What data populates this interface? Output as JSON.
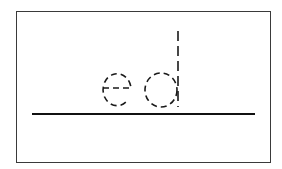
{
  "worksheet": {
    "trace_word": "ed",
    "letters": [
      {
        "char": "e",
        "style": "dashed-outline"
      },
      {
        "char": "d",
        "style": "dashed-outline"
      }
    ],
    "stroke_color": "#1a1a1a",
    "frame_color": "#3a3a3a",
    "baseline_color": "#111111",
    "background_color": "#ffffff"
  }
}
